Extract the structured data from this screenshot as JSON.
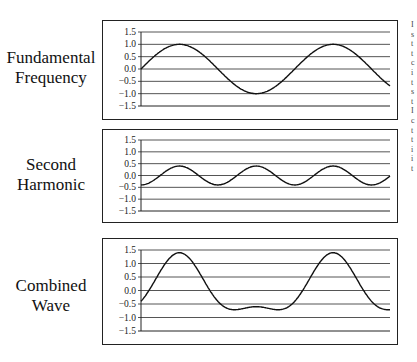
{
  "panels": [
    {
      "label_line1": "Fundamental",
      "label_line2": "Frequency",
      "yticks": [
        "1.5",
        "1.0",
        "0.5",
        "0.0",
        "−0.5",
        "−1.0",
        "−1.5"
      ],
      "components": [
        {
          "amp": 1.0,
          "cycles": 1.62,
          "phase": 0
        }
      ]
    },
    {
      "label_line1": "Second",
      "label_line2": "Harmonic",
      "yticks": [
        "1.5",
        "1.0",
        "0.5",
        "0.0",
        "−0.5",
        "−1.0",
        "−1.5"
      ],
      "components": [
        {
          "amp": 0.4,
          "cycles": 3.24,
          "phase": -1.57
        }
      ]
    },
    {
      "label_line1": "Combined",
      "label_line2": "Wave",
      "yticks": [
        "1.5",
        "1.0",
        "0.5",
        "0.0",
        "−0.5",
        "−1.0",
        "−1.5"
      ],
      "components": [
        {
          "amp": 1.0,
          "cycles": 1.62,
          "phase": 0
        },
        {
          "amp": 0.4,
          "cycles": 3.24,
          "phase": -1.57
        }
      ]
    }
  ],
  "chart_data": [
    {
      "type": "line",
      "title": "Fundamental Frequency",
      "ylim": [
        -1.5,
        1.5
      ],
      "yticks": [
        1.5,
        1.0,
        0.5,
        0.0,
        -0.5,
        -1.0,
        -1.5
      ],
      "grid": true,
      "series": [
        {
          "name": "fundamental",
          "description": "sine, amplitude 1.0, ~1.6 cycles, starts at 0.0, ends near -0.45"
        }
      ]
    },
    {
      "type": "line",
      "title": "Second Harmonic",
      "ylim": [
        -1.5,
        1.5
      ],
      "yticks": [
        1.5,
        1.0,
        0.5,
        0.0,
        -0.5,
        -1.0,
        -1.5
      ],
      "grid": true,
      "series": [
        {
          "name": "second harmonic",
          "description": "sine, amplitude 0.4, twice the frequency, starts at -0.4"
        }
      ]
    },
    {
      "type": "line",
      "title": "Combined Wave",
      "ylim": [
        -1.5,
        1.5
      ],
      "yticks": [
        1.5,
        1.0,
        0.5,
        0.0,
        -0.5,
        -1.0,
        -1.5
      ],
      "grid": true,
      "series": [
        {
          "name": "combined",
          "description": "sum of fundamental and second harmonic; peaks ~1.4, flattened trough ~-0.7 with local max ~-0.6"
        }
      ]
    }
  ],
  "side_text": "I\ns\nt\nt\nc\ni\nt\ns\nt\nI\nc\nt\nt\ni\ni\nt"
}
